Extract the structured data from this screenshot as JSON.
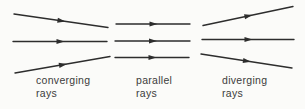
{
  "figure": {
    "background_color": "#fbfbf9",
    "stroke_color": "#2d2d2d",
    "text_color": "#3b3b3b",
    "stroke_width": 1.4,
    "groups": [
      {
        "id": "converging",
        "label_line1": "converging",
        "label_line2": "rays",
        "rays": [
          {
            "x1": 14,
            "y1": 14,
            "x2": 108,
            "y2": 27.5
          },
          {
            "x1": 13,
            "y1": 41.5,
            "x2": 107,
            "y2": 41.5
          },
          {
            "x1": 15,
            "y1": 73,
            "x2": 110,
            "y2": 56.5
          }
        ]
      },
      {
        "id": "parallel",
        "label_line1": "parallel",
        "label_line2": "rays",
        "rays": [
          {
            "x1": 116,
            "y1": 24,
            "x2": 190,
            "y2": 24
          },
          {
            "x1": 115,
            "y1": 41,
            "x2": 190,
            "y2": 41
          },
          {
            "x1": 115,
            "y1": 57.5,
            "x2": 189,
            "y2": 57.5
          }
        ]
      },
      {
        "id": "diverging",
        "label_line1": "diverging",
        "label_line2": "rays",
        "rays": [
          {
            "x1": 203,
            "y1": 25.5,
            "x2": 293,
            "y2": 6.5
          },
          {
            "x1": 202,
            "y1": 39.5,
            "x2": 294,
            "y2": 39.5
          },
          {
            "x1": 201,
            "y1": 54,
            "x2": 292,
            "y2": 68
          }
        ]
      }
    ]
  }
}
